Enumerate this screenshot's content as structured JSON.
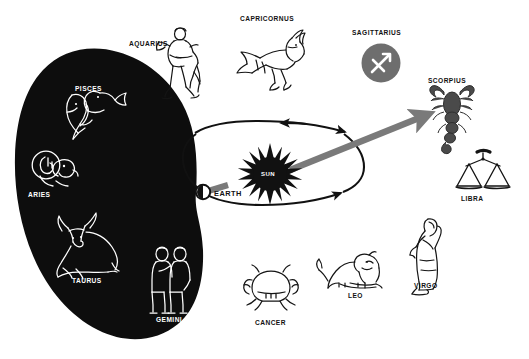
{
  "diagram": {
    "type": "astronomy-diagram",
    "background_color": "#ffffff",
    "night_side_color": "#0d0d0d",
    "sightline_color": "#7a7a7a",
    "orbit_color": "#111111"
  },
  "center": {
    "sun_label": "SUN",
    "sun_color": "#111111",
    "earth_label": "EARTH",
    "earth_label_color": "#111111"
  },
  "constellations": [
    {
      "id": "pisces",
      "label": "PISCES",
      "icon": "pisces-fish-icon",
      "on_dark": true,
      "stroke": "#ffffff",
      "label_x": 75,
      "label_y": 86,
      "icon_x": 57,
      "icon_y": 90
    },
    {
      "id": "aquarius",
      "label": "AQUARIUS",
      "icon": "aquarius-waterbearer-icon",
      "on_dark": false,
      "stroke": "#141414",
      "label_x": 129,
      "label_y": 41,
      "icon_x": 163,
      "icon_y": 26
    },
    {
      "id": "capricornus",
      "label": "CAPRICORNUS",
      "icon": "capricornus-seagoat-icon",
      "on_dark": false,
      "stroke": "#141414",
      "label_x": 240,
      "label_y": 16,
      "icon_x": 237,
      "icon_y": 24
    },
    {
      "id": "sagittarius",
      "label": "SAGITTARIUS",
      "icon": "sagittarius-arrow-icon",
      "on_dark": false,
      "stroke": "#ffffff",
      "badge_color": "#6e6e6e",
      "label_x": 352,
      "label_y": 30,
      "icon_x": 360,
      "icon_y": 43
    },
    {
      "id": "scorpius",
      "label": "SCORPIUS",
      "icon": "scorpius-scorpion-icon",
      "on_dark": false,
      "stroke": "#4a4a4a",
      "label_x": 428,
      "label_y": 78,
      "icon_x": 432,
      "icon_y": 86
    },
    {
      "id": "libra",
      "label": "LIBRA",
      "icon": "libra-scales-icon",
      "on_dark": false,
      "stroke": "#141414",
      "label_x": 461,
      "label_y": 196,
      "icon_x": 463,
      "icon_y": 148
    },
    {
      "id": "virgo",
      "label": "VIRGO",
      "icon": "virgo-maiden-icon",
      "on_dark": false,
      "stroke": "#141414",
      "label_x": 414,
      "label_y": 283,
      "icon_x": 414,
      "icon_y": 211
    },
    {
      "id": "leo",
      "label": "LEO",
      "icon": "leo-lion-icon",
      "on_dark": false,
      "stroke": "#141414",
      "label_x": 348,
      "label_y": 293,
      "icon_x": 325,
      "icon_y": 252
    },
    {
      "id": "cancer",
      "label": "CANCER",
      "icon": "cancer-crab-icon",
      "on_dark": false,
      "stroke": "#141414",
      "label_x": 255,
      "label_y": 320,
      "icon_x": 249,
      "icon_y": 264
    },
    {
      "id": "gemini",
      "label": "GEMINI",
      "icon": "gemini-twins-icon",
      "on_dark": true,
      "stroke": "#ffffff",
      "label_x": 156,
      "label_y": 317,
      "icon_x": 152,
      "icon_y": 247
    },
    {
      "id": "taurus",
      "label": "TAURUS",
      "icon": "taurus-bull-icon",
      "on_dark": true,
      "stroke": "#ffffff",
      "label_x": 72,
      "label_y": 278,
      "icon_x": 54,
      "icon_y": 223
    },
    {
      "id": "aries",
      "label": "ARIES",
      "icon": "aries-ram-icon",
      "on_dark": true,
      "stroke": "#ffffff",
      "label_x": 28,
      "label_y": 192,
      "icon_x": 33,
      "icon_y": 148
    }
  ]
}
